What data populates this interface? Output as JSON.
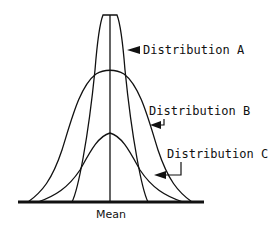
{
  "diagram": {
    "title": "",
    "labels": {
      "dist_a": "Distribution A",
      "dist_b": "Distribution B",
      "dist_c": "Distribution C",
      "mean": "Mean"
    },
    "curves": [
      {
        "name": "Distribution A",
        "description": "narrow, tallest peak"
      },
      {
        "name": "Distribution B",
        "description": "medium width, medium peak"
      },
      {
        "name": "Distribution C",
        "description": "widest spread relative to height, lowest peak"
      }
    ],
    "colors": {
      "line": "#111111",
      "background": "#ffffff"
    }
  }
}
